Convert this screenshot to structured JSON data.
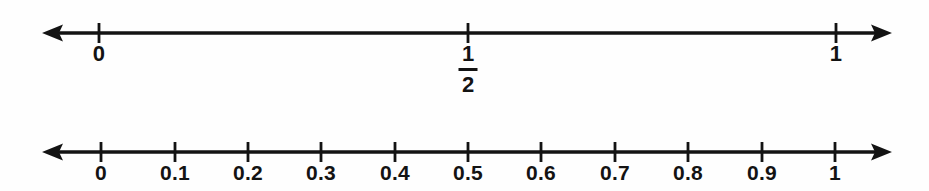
{
  "page": {
    "background_color": "#fefefe",
    "ink_color": "#131313",
    "width": 929,
    "height": 191
  },
  "chart_data": {
    "type": "table",
    "title": "",
    "subtitle": "",
    "xlabel": "",
    "ylabel": "",
    "grid": false,
    "legend": "none",
    "number_lines": [
      {
        "id": "halves",
        "name": "number-line-halves",
        "axis_y": 33,
        "arrow_left_x": 42,
        "arrow_right_x": 892,
        "arrow_style": "double",
        "xlim": [
          0,
          1
        ],
        "tick_step": 0.5,
        "ticks": [
          {
            "value": 0,
            "x": 99,
            "label": "0",
            "label_type": "integer"
          },
          {
            "value": 0.5,
            "x": 468,
            "label": "1/2",
            "label_type": "fraction",
            "numerator": "1",
            "denominator": "2"
          },
          {
            "value": 1,
            "x": 836,
            "label": "1",
            "label_type": "integer"
          }
        ]
      },
      {
        "id": "tenths",
        "name": "number-line-tenths",
        "axis_y": 42,
        "arrow_left_x": 42,
        "arrow_right_x": 892,
        "arrow_style": "double",
        "xlim": [
          0,
          1
        ],
        "tick_step": 0.1,
        "ticks": [
          {
            "value": 0,
            "x": 101,
            "label": "0",
            "label_type": "integer"
          },
          {
            "value": 0.1,
            "x": 175,
            "label": "0.1",
            "label_type": "decimal"
          },
          {
            "value": 0.2,
            "x": 248,
            "label": "0.2",
            "label_type": "decimal"
          },
          {
            "value": 0.3,
            "x": 321,
            "label": "0.3",
            "label_type": "decimal"
          },
          {
            "value": 0.4,
            "x": 395,
            "label": "0.4",
            "label_type": "decimal"
          },
          {
            "value": 0.5,
            "x": 468,
            "label": "0.5",
            "label_type": "decimal"
          },
          {
            "value": 0.6,
            "x": 541,
            "label": "0.6",
            "label_type": "decimal"
          },
          {
            "value": 0.7,
            "x": 615,
            "label": "0.7",
            "label_type": "decimal"
          },
          {
            "value": 0.8,
            "x": 688,
            "label": "0.8",
            "label_type": "decimal"
          },
          {
            "value": 0.9,
            "x": 762,
            "label": "0.9",
            "label_type": "decimal"
          },
          {
            "value": 1,
            "x": 835,
            "label": "1",
            "label_type": "integer"
          }
        ]
      }
    ]
  }
}
